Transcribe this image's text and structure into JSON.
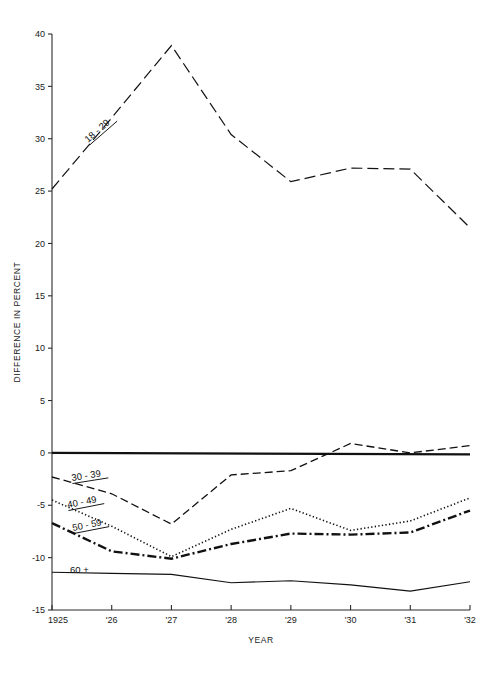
{
  "chart_data": {
    "type": "line",
    "title": "",
    "xlabel": "YEAR",
    "ylabel": "DIFFERENCE IN PERCENT",
    "x": [
      1925,
      1926,
      1927,
      1928,
      1929,
      1930,
      1931,
      1932
    ],
    "xtick_labels": [
      "1925",
      "'26",
      "'27",
      "'28",
      "'29",
      "'30",
      "'31",
      "'32"
    ],
    "ytick_labels": [
      "40",
      "35",
      "30",
      "25",
      "20",
      "15",
      "10",
      "5",
      "0",
      "-5",
      "-10",
      "-15"
    ],
    "ytick_values": [
      40,
      35,
      30,
      25,
      20,
      15,
      10,
      5,
      0,
      -5,
      -10,
      -15
    ],
    "ylim": [
      -15,
      40
    ],
    "xlim": [
      1925,
      1932
    ],
    "grid": false,
    "legend_position": "inline-annotations",
    "zero_reference_line": 0,
    "series": [
      {
        "name": "18 - 29",
        "label": "18 - 29",
        "style": "long-dash",
        "dasharray": "11,5",
        "width": 1.2,
        "values": [
          25.2,
          32.0,
          38.9,
          30.4,
          25.9,
          27.2,
          27.1,
          21.5
        ]
      },
      {
        "name": "30 - 39",
        "label": "30 - 39",
        "style": "dashed",
        "dasharray": "8,4",
        "width": 1.3,
        "values": [
          -2.3,
          -3.9,
          -6.8,
          -2.1,
          -1.7,
          0.9,
          0.0,
          0.7
        ]
      },
      {
        "name": "40 - 49",
        "label": "40 - 49",
        "style": "dotted",
        "dasharray": "1.3,2.3",
        "width": 1.6,
        "values": [
          -4.5,
          -7.0,
          -9.9,
          -7.3,
          -5.3,
          -7.4,
          -6.5,
          -4.3
        ]
      },
      {
        "name": "50 - 59",
        "label": "50 - 59",
        "style": "dash-dot",
        "dasharray": "9,3,2,3",
        "width": 2.4,
        "values": [
          -6.7,
          -9.4,
          -10.1,
          -8.7,
          -7.7,
          -7.8,
          -7.6,
          -5.5
        ]
      },
      {
        "name": "60 +",
        "label": "60 +",
        "style": "solid",
        "dasharray": "none",
        "width": 1.1,
        "values": [
          -11.4,
          -11.5,
          -11.6,
          -12.4,
          -12.2,
          -12.6,
          -13.2,
          -12.3
        ]
      }
    ],
    "annotations": [
      {
        "text": "18 - 29",
        "x_px": 88,
        "y_px": 143,
        "rotate": -41,
        "underline": true
      },
      {
        "text": "30 - 39",
        "x_px": 72,
        "y_px": 481,
        "rotate": -9,
        "underline": true
      },
      {
        "text": "40 - 49",
        "x_px": 68,
        "y_px": 508,
        "rotate": -11,
        "underline": true
      },
      {
        "text": "50 - 59",
        "x_px": 73,
        "y_px": 531,
        "rotate": -11,
        "underline": true
      },
      {
        "text": "60 +",
        "x_px": 70,
        "y_px": 573,
        "rotate": 0,
        "underline": false
      }
    ]
  }
}
